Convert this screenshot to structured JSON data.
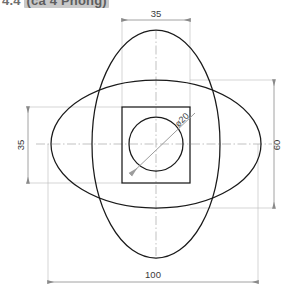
{
  "header": {
    "prefix": "4.4",
    "highlight": "(ca 4 Phong)",
    "visible": "partially cropped title row"
  },
  "drawing": {
    "title": "Orthographic sketch: four-lobed rosette of two ellipses with square and bored hole",
    "line_color": "#1a1a1a",
    "thin_line_color": "#8a8a8a",
    "center_line_color": "#9a9a9a",
    "background": "#ffffff",
    "dimensions": [
      {
        "name": "top-width",
        "value": "35",
        "orientation": "horizontal",
        "position": "top"
      },
      {
        "name": "left-height",
        "value": "35",
        "orientation": "vertical",
        "position": "left"
      },
      {
        "name": "right-height",
        "value": "60",
        "orientation": "vertical",
        "position": "right"
      },
      {
        "name": "bottom-width",
        "value": "100",
        "orientation": "horizontal",
        "position": "bottom"
      }
    ],
    "callout": {
      "name": "hole-diameter",
      "value": "ø20",
      "leader": "diagonal arrow to inner circle"
    },
    "shapes": {
      "horizontal_ellipse": {
        "rx": 100,
        "ry": 60,
        "note": "wide ellipse, 100 across"
      },
      "vertical_ellipse": {
        "rx": 60,
        "ry": 100,
        "note": "tall ellipse, 100 high"
      },
      "square": {
        "side": 35
      },
      "circle": {
        "diameter": 20
      }
    }
  }
}
